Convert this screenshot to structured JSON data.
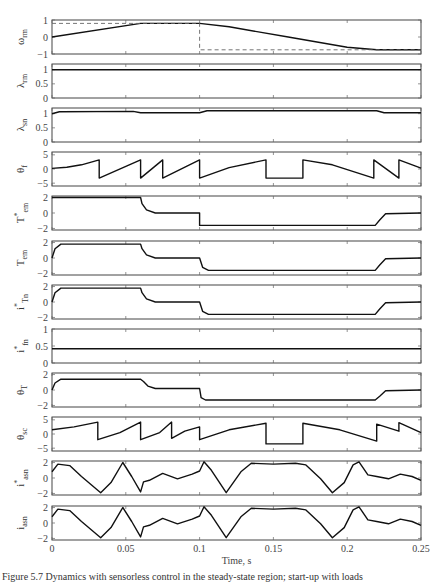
{
  "figure": {
    "caption_fragment": "Figure 5.7  Dynamics with sensorless control in the steady-state region; start-up with loads",
    "xlabel": "Time, s"
  },
  "chart_data": {
    "type": "line",
    "xlabel": "Time, s",
    "xlim": [
      0,
      0.25
    ],
    "xticks": [
      0,
      0.05,
      0.1,
      0.15,
      0.2,
      0.25
    ],
    "xtick_labels": [
      "0",
      "0.05",
      "0.1",
      "0.15",
      "0.2",
      "0.25"
    ],
    "grid": false,
    "panels": [
      {
        "id": "omega_rm",
        "ylabel": "ω",
        "ysub": "rm",
        "ystar": false,
        "ylim": [
          -1,
          1
        ],
        "yticks": [
          -1,
          0,
          1
        ],
        "series": [
          {
            "name": "omega_rm",
            "style": "solid",
            "x": [
              0,
              0.06,
              0.1,
              0.12,
              0.16,
              0.2,
              0.22,
              0.25
            ],
            "y": [
              0,
              0.8,
              0.8,
              0.6,
              0.0,
              -0.6,
              -0.75,
              -0.75
            ]
          },
          {
            "name": "omega_rm_ref",
            "style": "dashed",
            "x": [
              0,
              0.1,
              0.1,
              0.25
            ],
            "y": [
              0.8,
              0.8,
              -0.75,
              -0.75
            ]
          }
        ]
      },
      {
        "id": "lambda_rm",
        "ylabel": "λ",
        "ysub": "rm",
        "ystar": false,
        "ylim": [
          0,
          1.2
        ],
        "yticks": [
          0,
          0.5,
          1
        ],
        "series": [
          {
            "name": "lambda_rm",
            "style": "solid",
            "x": [
              0,
              0.25
            ],
            "y": [
              1.0,
              1.0
            ]
          }
        ]
      },
      {
        "id": "lambda_sn",
        "ylabel": "λ",
        "ysub": "sn",
        "ystar": false,
        "ylim": [
          0,
          1.2
        ],
        "yticks": [
          0,
          0.5,
          1
        ],
        "series": [
          {
            "name": "lambda_sn",
            "style": "solid",
            "x": [
              0,
              0.005,
              0.055,
              0.06,
              0.1,
              0.105,
              0.22,
              0.225,
              0.25
            ],
            "y": [
              1.0,
              1.07,
              1.08,
              1.03,
              1.03,
              1.1,
              1.1,
              1.03,
              1.03
            ]
          }
        ]
      },
      {
        "id": "theta_f",
        "ylabel": "θ",
        "ysub": "f",
        "ystar": false,
        "ylim": [
          -6,
          6
        ],
        "yticks": [
          -5,
          0,
          5
        ],
        "series": [
          {
            "name": "theta_f",
            "style": "solid",
            "x": [
              0,
              0.01,
              0.02,
              0.032,
              0.032,
              0.06,
              0.06,
              0.075,
              0.075,
              0.1,
              0.1,
              0.12,
              0.145,
              0.145,
              0.17,
              0.17,
              0.19,
              0.218,
              0.218,
              0.235,
              0.235,
              0.25
            ],
            "y": [
              0.2,
              0.6,
              1.5,
              3.2,
              -3.2,
              3.2,
              -3.2,
              3.2,
              -3.2,
              3.2,
              -3.2,
              0.5,
              3.2,
              -3.2,
              -3.2,
              3.2,
              1.5,
              -3.2,
              3.2,
              -3.2,
              3.2,
              0.3
            ]
          }
        ]
      },
      {
        "id": "T_em_ref",
        "ylabel": "T",
        "ysub": "em",
        "ystar": true,
        "ylim": [
          -2.2,
          2.2
        ],
        "yticks": [
          -2,
          0,
          2
        ],
        "series": [
          {
            "name": "T_em_ref",
            "style": "solid",
            "x": [
              0,
              0.06,
              0.061,
              0.064,
              0.07,
              0.1,
              0.1,
              0.219,
              0.222,
              0.226,
              0.25
            ],
            "y": [
              2.0,
              2.0,
              1.2,
              0.4,
              0.0,
              0.0,
              -1.6,
              -1.6,
              -0.9,
              -0.1,
              0.0
            ]
          }
        ]
      },
      {
        "id": "T_em",
        "ylabel": "T",
        "ysub": "em",
        "ystar": false,
        "ylim": [
          -2.2,
          2.2
        ],
        "yticks": [
          -2,
          0,
          2
        ],
        "series": [
          {
            "name": "T_em",
            "style": "solid",
            "x": [
              0,
              0.002,
              0.006,
              0.06,
              0.061,
              0.064,
              0.07,
              0.1,
              0.102,
              0.106,
              0.219,
              0.222,
              0.226,
              0.25
            ],
            "y": [
              0,
              1.2,
              1.8,
              1.8,
              1.2,
              0.4,
              0.0,
              0.0,
              -1.2,
              -1.6,
              -1.6,
              -0.9,
              -0.1,
              0.0
            ]
          }
        ]
      },
      {
        "id": "i_Tn_ref",
        "ylabel": "i",
        "ysub": "Tn",
        "ystar": true,
        "ylim": [
          -2.2,
          2.2
        ],
        "yticks": [
          -2,
          0,
          2
        ],
        "series": [
          {
            "name": "i_Tn_ref",
            "style": "solid",
            "x": [
              0,
              0.002,
              0.006,
              0.06,
              0.061,
              0.064,
              0.07,
              0.1,
              0.102,
              0.106,
              0.219,
              0.222,
              0.226,
              0.25
            ],
            "y": [
              0,
              1.2,
              1.8,
              1.8,
              1.2,
              0.4,
              0.0,
              0.0,
              -1.2,
              -1.6,
              -1.6,
              -0.9,
              -0.1,
              0.0
            ]
          }
        ]
      },
      {
        "id": "i_fn_ref",
        "ylabel": "i",
        "ysub": "fn",
        "ystar": true,
        "ylim": [
          0,
          1
        ],
        "yticks": [
          0,
          0.5,
          1
        ],
        "series": [
          {
            "name": "i_fn_ref",
            "style": "solid",
            "x": [
              0,
              0.25
            ],
            "y": [
              0.42,
              0.42
            ]
          }
        ]
      },
      {
        "id": "theta_T",
        "ylabel": "θ",
        "ysub": "T",
        "ystar": false,
        "ylim": [
          -2.2,
          2.2
        ],
        "yticks": [
          -2,
          0,
          2
        ],
        "series": [
          {
            "name": "theta_T",
            "style": "solid",
            "x": [
              0,
              0.002,
              0.006,
              0.06,
              0.062,
              0.065,
              0.07,
              0.1,
              0.101,
              0.104,
              0.219,
              0.222,
              0.226,
              0.25
            ],
            "y": [
              0,
              0.9,
              1.4,
              1.4,
              1.1,
              0.5,
              0.2,
              0.2,
              -1.0,
              -1.3,
              -1.3,
              -0.8,
              -0.1,
              0.0
            ]
          }
        ]
      },
      {
        "id": "theta_sc",
        "ylabel": "θ",
        "ysub": "sc",
        "ystar": false,
        "ylim": [
          -6,
          6
        ],
        "yticks": [
          -5,
          0,
          5
        ],
        "series": [
          {
            "name": "theta_sc",
            "style": "solid",
            "x": [
              0,
              0.015,
              0.031,
              0.031,
              0.046,
              0.06,
              0.06,
              0.073,
              0.081,
              0.081,
              0.09,
              0.1,
              0.1,
              0.12,
              0.145,
              0.145,
              0.17,
              0.17,
              0.195,
              0.22,
              0.22,
              0.235,
              0.235,
              0.25
            ],
            "y": [
              1.5,
              2.5,
              4.2,
              -2.0,
              0.5,
              4.2,
              -2.0,
              0.5,
              4.2,
              -1.5,
              1.0,
              2.5,
              -2.0,
              1.5,
              3.8,
              -3.5,
              -3.5,
              3.8,
              1.5,
              -2.5,
              3.5,
              1.0,
              4.0,
              0.5
            ]
          }
        ]
      },
      {
        "id": "i_asn_ref",
        "ylabel": "i",
        "ysub": "asn",
        "ystar": true,
        "ylim": [
          -2.2,
          2.2
        ],
        "yticks": [
          -2,
          0,
          2
        ],
        "series": [
          {
            "name": "i_asn_ref",
            "style": "solid",
            "x": [
              0,
              0.004,
              0.012,
              0.02,
              0.033,
              0.04,
              0.048,
              0.054,
              0.06,
              0.062,
              0.066,
              0.075,
              0.085,
              0.095,
              0.1,
              0.103,
              0.108,
              0.118,
              0.128,
              0.135,
              0.15,
              0.165,
              0.172,
              0.182,
              0.19,
              0.198,
              0.204,
              0.208,
              0.214,
              0.22,
              0.228,
              0.236,
              0.244,
              0.25
            ],
            "y": [
              0.8,
              1.8,
              1.6,
              0.2,
              -1.9,
              -0.6,
              2.0,
              0.2,
              -1.8,
              -0.5,
              -0.3,
              0.6,
              -0.1,
              0.5,
              0.9,
              2.1,
              1.0,
              -1.9,
              0.8,
              1.9,
              1.8,
              1.9,
              1.7,
              -0.1,
              -1.9,
              -0.6,
              1.7,
              2.1,
              0.4,
              0.2,
              -0.1,
              0.5,
              0.2,
              -0.3
            ]
          }
        ]
      },
      {
        "id": "i_asn",
        "ylabel": "i",
        "ysub": "asn",
        "ystar": false,
        "ylim": [
          -2.2,
          2.2
        ],
        "yticks": [
          -2,
          0,
          2
        ],
        "series": [
          {
            "name": "i_asn",
            "style": "solid",
            "x": [
              0,
              0.004,
              0.012,
              0.02,
              0.033,
              0.04,
              0.048,
              0.054,
              0.06,
              0.062,
              0.066,
              0.075,
              0.085,
              0.095,
              0.1,
              0.103,
              0.108,
              0.118,
              0.128,
              0.135,
              0.15,
              0.165,
              0.172,
              0.182,
              0.19,
              0.198,
              0.204,
              0.208,
              0.214,
              0.22,
              0.228,
              0.236,
              0.244,
              0.25
            ],
            "y": [
              0.8,
              1.8,
              1.6,
              0.2,
              -1.9,
              -0.6,
              2.0,
              0.2,
              -1.8,
              -0.5,
              -0.3,
              0.6,
              -0.1,
              0.5,
              0.9,
              2.1,
              1.0,
              -1.9,
              0.8,
              1.9,
              1.8,
              1.9,
              1.7,
              -0.1,
              -1.9,
              -0.6,
              1.7,
              2.1,
              0.4,
              0.2,
              -0.1,
              0.5,
              0.2,
              -0.3
            ]
          }
        ]
      }
    ]
  }
}
